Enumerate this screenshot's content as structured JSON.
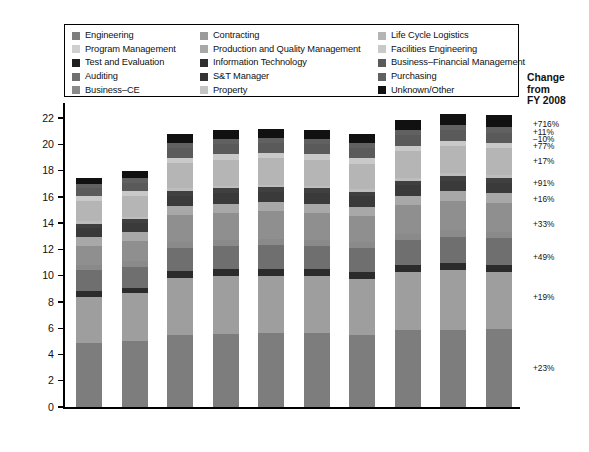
{
  "chart_data": {
    "type": "bar",
    "subtype": "stacked-bar",
    "title": "",
    "xlabel": "FY",
    "ylabel": "In FY 2017 dollars (billions)",
    "categories": [
      "2008",
      "2009",
      "2010",
      "2011",
      "2012",
      "2013",
      "2014",
      "2015",
      "2016",
      "2017"
    ],
    "ylim": [
      0,
      23
    ],
    "yticks": [
      0,
      2,
      4,
      6,
      8,
      10,
      12,
      14,
      16,
      18,
      20,
      22
    ],
    "grid": false,
    "legend_position": "top",
    "series": [
      {
        "name": "Engineering",
        "color": "#7d7d7d",
        "values": [
          4.85,
          5.05,
          5.45,
          5.55,
          5.6,
          5.6,
          5.5,
          5.85,
          5.9,
          5.95
        ]
      },
      {
        "name": "Program Management",
        "color": "#9e9e9e",
        "values": [
          3.55,
          3.6,
          4.35,
          4.4,
          4.4,
          4.35,
          4.25,
          4.45,
          4.55,
          4.3
        ]
      },
      {
        "name": "Test and Evaluation",
        "color": "#2b2b2b",
        "values": [
          0.45,
          0.45,
          0.55,
          0.55,
          0.55,
          0.55,
          0.55,
          0.55,
          0.55,
          0.55
        ]
      },
      {
        "name": "Auditing",
        "color": "#6f6f6f",
        "values": [
          1.55,
          1.6,
          1.75,
          1.75,
          1.8,
          1.8,
          1.8,
          1.9,
          1.95,
          2.05
        ]
      },
      {
        "name": "Business–CE",
        "color": "#8a8a8a",
        "values": [
          0.4,
          0.4,
          0.45,
          0.45,
          0.45,
          0.45,
          0.45,
          0.45,
          0.5,
          0.5
        ]
      },
      {
        "name": "Contracting",
        "color": "#8f8f8f",
        "values": [
          1.5,
          1.55,
          2.05,
          2.1,
          2.1,
          2.05,
          2.0,
          2.2,
          2.25,
          2.2
        ]
      },
      {
        "name": "Production and Quality Management",
        "color": "#a8a8a8",
        "values": [
          0.65,
          0.65,
          0.7,
          0.7,
          0.7,
          0.7,
          0.7,
          0.7,
          0.75,
          0.75
        ]
      },
      {
        "name": "Information Technology",
        "color": "#3a3a3a",
        "values": [
          0.7,
          0.7,
          0.8,
          0.8,
          0.8,
          0.8,
          0.8,
          0.8,
          0.8,
          0.8
        ]
      },
      {
        "name": "S&T Manager",
        "color": "#404040",
        "values": [
          0.3,
          0.3,
          0.35,
          0.35,
          0.35,
          0.35,
          0.35,
          0.35,
          0.35,
          0.35
        ]
      },
      {
        "name": "Property",
        "color": "#bdbdbd",
        "values": [
          0.2,
          0.2,
          0.2,
          0.2,
          0.2,
          0.2,
          0.2,
          0.2,
          0.2,
          0.2
        ]
      },
      {
        "name": "Life Cycle Logistics",
        "color": "#b5b5b5",
        "values": [
          1.55,
          1.6,
          1.95,
          2.0,
          2.0,
          2.0,
          1.95,
          2.05,
          2.1,
          2.05
        ]
      },
      {
        "name": "Facilities Engineering",
        "color": "#c9c9c9",
        "values": [
          0.35,
          0.35,
          0.4,
          0.4,
          0.4,
          0.4,
          0.4,
          0.4,
          0.4,
          0.4
        ]
      },
      {
        "name": "Business–Financial Management",
        "color": "#5a5a5a",
        "values": [
          0.6,
          0.65,
          0.75,
          0.75,
          0.75,
          0.75,
          0.75,
          0.8,
          0.8,
          0.8
        ]
      },
      {
        "name": "Purchasing",
        "color": "#616161",
        "values": [
          0.35,
          0.35,
          0.4,
          0.4,
          0.4,
          0.4,
          0.4,
          0.4,
          0.4,
          0.4
        ]
      },
      {
        "name": "Unknown/Other",
        "color": "#111111",
        "values": [
          0.45,
          0.5,
          0.65,
          0.7,
          0.7,
          0.7,
          0.7,
          0.75,
          0.85,
          0.95
        ]
      }
    ],
    "totals": [
      16.85,
      17.8,
      19.8,
      20.3,
      20.35,
      20.25,
      20.0,
      20.95,
      21.55,
      22.0
    ],
    "annotations": {
      "header": "Change\nfrom\nFY 2008",
      "items": [
        {
          "label": "+716%",
          "y": 21.55
        },
        {
          "label": "+11%",
          "y": 20.95
        },
        {
          "label": "−10%",
          "y": 20.4
        },
        {
          "label": "+77%",
          "y": 19.85
        },
        {
          "label": "+17%",
          "y": 18.75
        },
        {
          "label": "+91%",
          "y": 17.05
        },
        {
          "label": "+16%",
          "y": 15.85
        },
        {
          "label": "+33%",
          "y": 13.95
        },
        {
          "label": "+49%",
          "y": 11.4
        },
        {
          "label": "+19%",
          "y": 8.35
        },
        {
          "label": "+23%",
          "y": 3.0
        }
      ]
    }
  },
  "legend": {
    "columns": [
      [
        {
          "label": "Engineering",
          "color": "#7d7d7d"
        },
        {
          "label": "Program Management",
          "color": "#cfcfcf"
        },
        {
          "label": "Test and Evaluation",
          "color": "#1f1f1f"
        },
        {
          "label": "Auditing",
          "color": "#6f6f6f"
        },
        {
          "label": "Business–CE",
          "color": "#8a8a8a"
        }
      ],
      [
        {
          "label": "Contracting",
          "color": "#9a9a9a"
        },
        {
          "label": "Production and Quality Management",
          "color": "#a8a8a8"
        },
        {
          "label": "Information Technology",
          "color": "#2e2e2e"
        },
        {
          "label": "S&T Manager",
          "color": "#333333"
        },
        {
          "label": "Property",
          "color": "#c4c4c4"
        }
      ],
      [
        {
          "label": "Life Cycle Logistics",
          "color": "#b5b5b5"
        },
        {
          "label": "Facilities Engineering",
          "color": "#c9c9c9"
        },
        {
          "label": "Business–Financial Management",
          "color": "#5a5a5a"
        },
        {
          "label": "Purchasing",
          "color": "#616161"
        },
        {
          "label": "Unknown/Other",
          "color": "#111111"
        }
      ]
    ]
  },
  "axis": {
    "y_title": "In FY 2017 dollars (billions)",
    "x_title": "FY"
  }
}
